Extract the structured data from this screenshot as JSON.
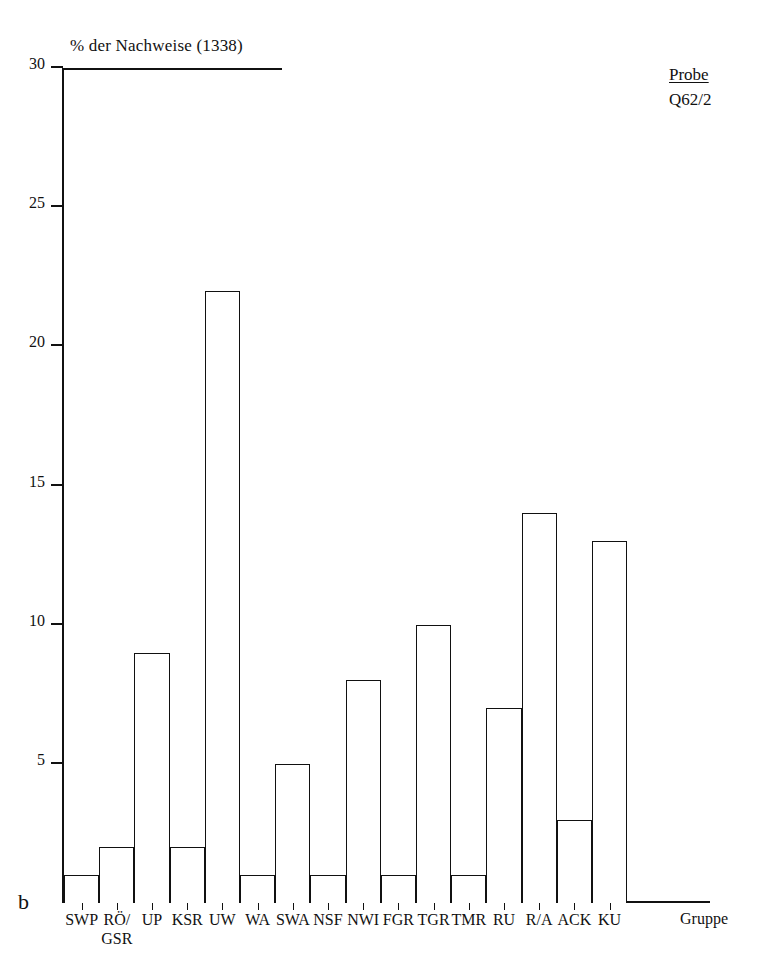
{
  "figure": {
    "letter": "b",
    "sample_label": "Probe",
    "sample_value": "Q62/2"
  },
  "chart_data": {
    "type": "bar",
    "title": "% der Nachweise (1338)",
    "xlabel": "Gruppe",
    "ylabel": "% der Nachweise (1338)",
    "categories": [
      "SWP",
      "RÖ/\nGSR",
      "UP",
      "KSR",
      "UW",
      "WA",
      "SWA",
      "NSF",
      "NWI",
      "FGR",
      "TGR",
      "TMR",
      "RU",
      "R/A",
      "ACK",
      "KU"
    ],
    "values": [
      1,
      2,
      9,
      2,
      22,
      1,
      5,
      1,
      8,
      1,
      10,
      1,
      7,
      14,
      3,
      13
    ],
    "ylim": [
      0,
      30
    ],
    "yticks": [
      5,
      10,
      15,
      20,
      25,
      30
    ],
    "ytick_labels": [
      "5",
      "10",
      "15",
      "20",
      "25",
      "30"
    ],
    "grid": false,
    "legend": "none",
    "total_count": 1338,
    "bar_fill": "#ffffff",
    "bar_stroke": "#111111"
  }
}
